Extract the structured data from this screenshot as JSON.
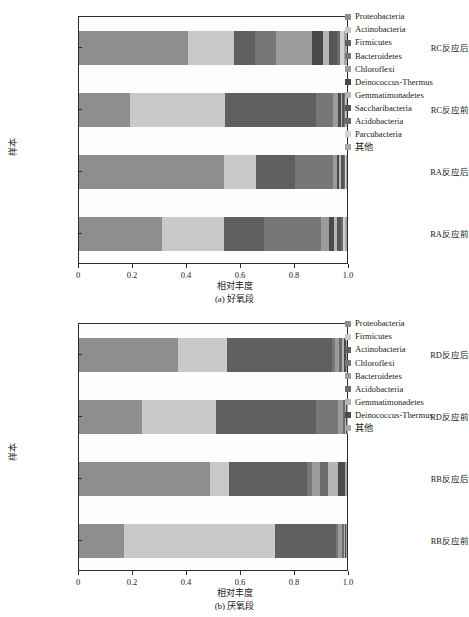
{
  "figure": {
    "title_a": "(a) 好氧段",
    "title_b": "(b) 厌氧段"
  },
  "palette": {
    "proteobacteria": "#8e8e8e",
    "actinobacteria": "#c9c9c9",
    "firmicutes": "#5f5f5f",
    "bacteroidetes": "#777777",
    "chloroflexi": "#9c9c9c",
    "deinococcus_thermus": "#4a4a4a",
    "gemmatimonadetes": "#b5b5b5",
    "saccharibacteria": "#555555",
    "acidobacteria": "#6b6b6b",
    "parcubacteria": "#d2d2d2",
    "other": "#a8a8a8",
    "axis": "#2b2b2b",
    "plot_bg": "#fdfdfd",
    "page_bg": "#ffffff"
  },
  "chart_data": [
    {
      "id": "panel-a",
      "type": "bar",
      "orientation": "horizontal",
      "stacked": true,
      "normalized": true,
      "title": "(a) 好氧段",
      "xlabel": "相对丰度",
      "ylabel": "样本",
      "xlim": [
        0,
        1.0
      ],
      "xticks": [
        0,
        0.2,
        0.4,
        0.6,
        0.8,
        1.0
      ],
      "xticklabels": [
        "0",
        "0.2",
        "0.4",
        "0.6",
        "0.8",
        "1.0"
      ],
      "grid": false,
      "legend_position": "right",
      "categories": [
        "RA反应前",
        "RA反应后",
        "RC反应前",
        "RC反应后"
      ],
      "categories_top_to_bottom": [
        "RC反应后",
        "RC反应前",
        "RA反应后",
        "RA反应前"
      ],
      "series": [
        {
          "name": "Proteobacteria",
          "color": "#8e8e8e",
          "values": [
            0.31,
            0.54,
            0.192,
            0.408
          ]
        },
        {
          "name": "Actinobacteria",
          "color": "#c9c9c9",
          "values": [
            0.232,
            0.12,
            0.352,
            0.17
          ]
        },
        {
          "name": "Firmicutes",
          "color": "#5f5f5f",
          "values": [
            0.148,
            0.145,
            0.342,
            0.078
          ]
        },
        {
          "name": "Bacteroidetes",
          "color": "#777777",
          "values": [
            0.212,
            0.143,
            0.062,
            0.078
          ]
        },
        {
          "name": "Chloroflexi",
          "color": "#9c9c9c",
          "values": [
            0.03,
            0.015,
            0.018,
            0.136
          ]
        },
        {
          "name": "Deinococcus-Thermus",
          "color": "#4a4a4a",
          "values": [
            0.018,
            0.009,
            0.01,
            0.042
          ]
        },
        {
          "name": "Gemmatimonadetes",
          "color": "#b5b5b5",
          "values": [
            0.014,
            0.007,
            0.007,
            0.02
          ]
        },
        {
          "name": "Saccharibacteria",
          "color": "#555555",
          "values": [
            0.012,
            0.008,
            0.006,
            0.03
          ]
        },
        {
          "name": "Acidobacteria",
          "color": "#6b6b6b",
          "values": [
            0.01,
            0.006,
            0.005,
            0.012
          ]
        },
        {
          "name": "Parcubacteria",
          "color": "#d2d2d2",
          "values": [
            0.008,
            0.004,
            0.004,
            0.014
          ]
        },
        {
          "name": "其他",
          "color": "#a8a8a8",
          "values": [
            0.006,
            0.003,
            0.002,
            0.012
          ]
        }
      ]
    },
    {
      "id": "panel-b",
      "type": "bar",
      "orientation": "horizontal",
      "stacked": true,
      "normalized": true,
      "title": "(b) 厌氧段",
      "xlabel": "相对丰度",
      "ylabel": "样本",
      "xlim": [
        0,
        1.0
      ],
      "xticks": [
        0,
        0.2,
        0.4,
        0.6,
        0.8,
        1.0
      ],
      "xticklabels": [
        "0",
        "0.2",
        "0.4",
        "0.6",
        "0.8",
        "1.0"
      ],
      "grid": false,
      "legend_position": "right",
      "categories": [
        "RB反应前",
        "RB反应后",
        "RD反应前",
        "RD反应后"
      ],
      "categories_top_to_bottom": [
        "RD反应后",
        "RD反应前",
        "RB反应后",
        "RB反应前"
      ],
      "series": [
        {
          "name": "Proteobacteria",
          "color": "#8e8e8e",
          "values": [
            0.168,
            0.49,
            0.236,
            0.368
          ]
        },
        {
          "name": "Firmicutes",
          "color": "#c9c9c9",
          "values": [
            0.562,
            0.068,
            0.276,
            0.184
          ]
        },
        {
          "name": "Actinobacteria",
          "color": "#5f5f5f",
          "values": [
            0.228,
            0.292,
            0.372,
            0.392
          ]
        },
        {
          "name": "Chloroflexi",
          "color": "#777777",
          "values": [
            0.01,
            0.018,
            0.082,
            0.012
          ]
        },
        {
          "name": "Bacteroidetes",
          "color": "#9c9c9c",
          "values": [
            0.012,
            0.032,
            0.018,
            0.016
          ]
        },
        {
          "name": "Acidobacteria",
          "color": "#6b6b6b",
          "values": [
            0.008,
            0.028,
            0.008,
            0.01
          ]
        },
        {
          "name": "Gemmatimonadetes",
          "color": "#b5b5b5",
          "values": [
            0.006,
            0.038,
            0.004,
            0.008
          ]
        },
        {
          "name": "Deinococcus-Thermus",
          "color": "#4a4a4a",
          "values": [
            0.004,
            0.026,
            0.003,
            0.006
          ]
        },
        {
          "name": "其他",
          "color": "#a8a8a8",
          "values": [
            0.002,
            0.008,
            0.001,
            0.004
          ]
        }
      ]
    }
  ]
}
